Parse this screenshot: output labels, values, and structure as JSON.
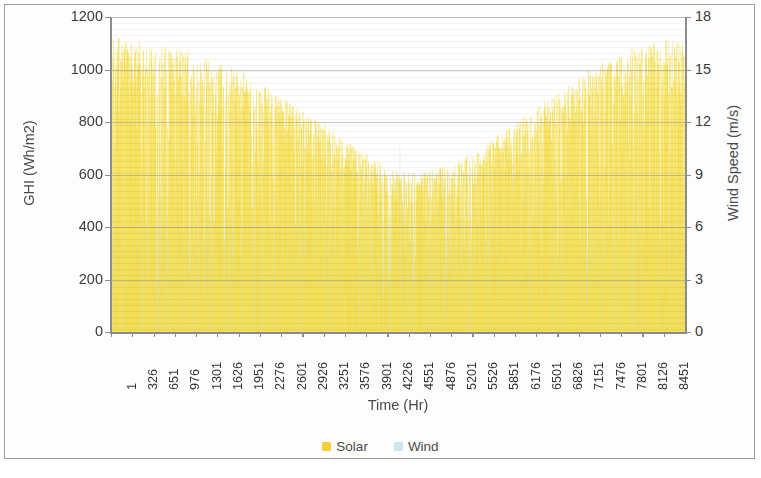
{
  "chart_data": {
    "type": "area",
    "title": "",
    "subtitle": "",
    "xlabel": "Time (Hr)",
    "ylabel": "GHI (Wh/m2)",
    "y2label": "Wind Speed (m/s)",
    "grid": true,
    "legend_position": "bottom",
    "xlim": [
      1,
      8760
    ],
    "ylim": [
      0,
      1200
    ],
    "y2lim": [
      0,
      18
    ],
    "yticks": [
      0,
      200,
      400,
      600,
      800,
      1000,
      1200
    ],
    "y2ticks": [
      0,
      3,
      6,
      9,
      12,
      15,
      18
    ],
    "ytick_labels": [
      "0",
      "200",
      "400",
      "600",
      "800",
      "1000",
      "1200"
    ],
    "y2tick_labels": [
      "0",
      "3",
      "6",
      "9",
      "12",
      "15",
      "18"
    ],
    "xtick_labels": [
      "1",
      "326",
      "651",
      "976",
      "1301",
      "1626",
      "1951",
      "2276",
      "2601",
      "2926",
      "3251",
      "3576",
      "3901",
      "4226",
      "4551",
      "4876",
      "5201",
      "5526",
      "5851",
      "6176",
      "6501",
      "6826",
      "7151",
      "7476",
      "7801",
      "8126",
      "8451"
    ],
    "xtick_values": [
      1,
      326,
      651,
      976,
      1301,
      1626,
      1951,
      2276,
      2601,
      2926,
      3251,
      3576,
      3901,
      4226,
      4551,
      4876,
      5201,
      5526,
      5851,
      6176,
      6501,
      6826,
      7151,
      7476,
      7801,
      8126,
      8451
    ],
    "xtick_step": 325,
    "series": [
      {
        "name": "Solar",
        "axis": "left",
        "color": "#F5DF4D",
        "units": "Wh/m2",
        "description": "Hourly global horizontal irradiance over a full year, plotted as dense vertical columns. Daily peak envelope is U-shaped: high (~1100) at the start and end of the year, lowest (~600) mid-year.",
        "envelope_x": [
          1,
          326,
          651,
          976,
          1301,
          1626,
          1951,
          2276,
          2601,
          2926,
          3251,
          3576,
          3901,
          4226,
          4551,
          4876,
          5201,
          5526,
          5851,
          6176,
          6501,
          6826,
          7151,
          7476,
          7801,
          8126,
          8451,
          8760
        ],
        "envelope_max": [
          1130,
          1110,
          1105,
          1095,
          1060,
          1030,
          1000,
          950,
          900,
          840,
          790,
          730,
          680,
          625,
          612,
          615,
          640,
          690,
          745,
          800,
          860,
          915,
          975,
          1030,
          1075,
          1105,
          1120,
          1130
        ],
        "min_daily_peak": 610,
        "max_daily_peak": 1130
      },
      {
        "name": "Wind",
        "axis": "right",
        "color": "#CDE6F2",
        "units": "m/s",
        "description": "Hourly wind speed over a full year, plotted as a dense light-blue column field. Typical values cluster around 4-7 m/s with occasional gusts to 10-12 m/s.",
        "typical_min": 0.2,
        "typical_band_top": 5.2,
        "typical_band_bottom": 3.6,
        "gust_max": 12.0,
        "mean": 4.9
      }
    ],
    "legend": [
      {
        "label": "Solar",
        "color": "#F5CE3E",
        "marker": "square"
      },
      {
        "label": "Wind",
        "color": "#CDE6F2",
        "marker": "square"
      }
    ]
  },
  "axes": {
    "left": {
      "title": "GHI (Wh/m2)",
      "ticks": [
        "0",
        "200",
        "400",
        "600",
        "800",
        "1000",
        "1200"
      ]
    },
    "right": {
      "title": "Wind Speed (m/s)",
      "ticks": [
        "0",
        "3",
        "6",
        "9",
        "12",
        "15",
        "18"
      ]
    },
    "bottom": {
      "title": "Time (Hr)"
    }
  },
  "colors": {
    "solar": "#F5DF4D",
    "solar_legend": "#F5CE3E",
    "wind": "#CDE6F2",
    "axis_line": "#8C8C8C",
    "grid_line": "#C9C9C9",
    "text": "#3B3B3B",
    "frame": "#9A9A9A",
    "background": "#FFFFFF"
  }
}
